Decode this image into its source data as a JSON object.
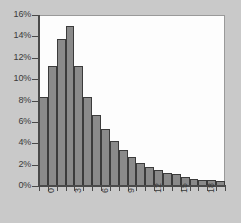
{
  "chart_data": {
    "type": "bar",
    "title": "",
    "subtitle": "",
    "xlabel": "",
    "ylabel": "",
    "grid": false,
    "legend": null,
    "xlim": [
      0,
      21
    ],
    "ylim": [
      0,
      16
    ],
    "y_tick_labels": [
      "0%",
      "2%",
      "4%",
      "6%",
      "8%",
      "10%",
      "12%",
      "14%",
      "16%"
    ],
    "y_tick_values": [
      0,
      2,
      4,
      6,
      8,
      10,
      12,
      14,
      16
    ],
    "x_tick_labels": [
      "0",
      "3",
      "6",
      "9",
      "12",
      "15",
      "18"
    ],
    "x_tick_values": [
      0,
      3,
      6,
      9,
      12,
      15,
      18
    ],
    "categories": [
      "0",
      "1",
      "2",
      "3",
      "4",
      "5",
      "6",
      "7",
      "8",
      "9",
      "10",
      "11",
      "12",
      "13",
      "14",
      "15",
      "16",
      "17",
      "18",
      "19",
      "20"
    ],
    "values": [
      8.3,
      11.2,
      13.8,
      15.0,
      11.2,
      8.3,
      6.6,
      5.3,
      4.2,
      3.4,
      2.7,
      2.2,
      1.8,
      1.5,
      1.2,
      1.1,
      0.8,
      0.7,
      0.6,
      0.6,
      0.5
    ],
    "value_unit": "%",
    "bar_color": "#8a8a8a",
    "bar_edge_color": "#3b3b3b",
    "plot_background": "#fdfdfd",
    "figure_background": "#c9c9c9",
    "axis_color": "#4a4a4a",
    "text_color": "#3a3a3a"
  }
}
